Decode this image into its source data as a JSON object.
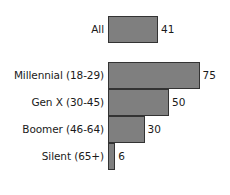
{
  "chart_data": {
    "type": "bar",
    "orientation": "horizontal",
    "title": "",
    "subtitle": "",
    "xlabel": "",
    "ylabel": "",
    "xlim": [
      0,
      100
    ],
    "grid": false,
    "legend": false,
    "value_labels": true,
    "categories": [
      "All",
      "Millennial (18-29)",
      "Gen X (30-45)",
      "Boomer (46-64)",
      "Silent (65+)"
    ],
    "values": [
      41,
      75,
      50,
      30,
      6
    ],
    "groups": [
      {
        "name": "overall",
        "categories": [
          "All"
        ],
        "values": [
          41
        ]
      },
      {
        "name": "generations",
        "categories": [
          "Millennial (18-29)",
          "Gen X (30-45)",
          "Boomer (46-64)",
          "Silent (65+)"
        ],
        "values": [
          75,
          50,
          30,
          6
        ]
      }
    ],
    "bar_color": "#7f7f7f",
    "bar_border_color": "#333333",
    "background_color": "#ffffff",
    "text_color": "#1a1a1a"
  },
  "rows": {
    "all": {
      "label": "All",
      "value": "41"
    },
    "millennial": {
      "label": "Millennial (18-29)",
      "value": "75"
    },
    "genx": {
      "label": "Gen X (30-45)",
      "value": "50"
    },
    "boomer": {
      "label": "Boomer (46-64)",
      "value": "30"
    },
    "silent": {
      "label": "Silent (65+)",
      "value": "6"
    }
  }
}
